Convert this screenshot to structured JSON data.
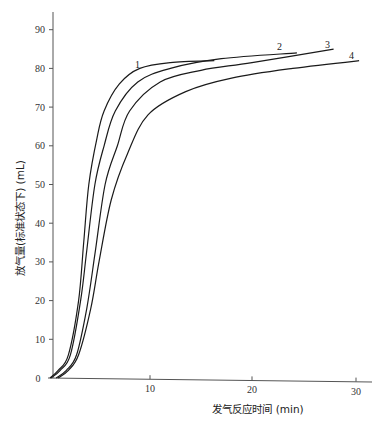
{
  "chart_data": {
    "type": "line",
    "title": "",
    "xlabel": "发气反应时间 (min)",
    "ylabel": "放气量(标准状态下) (mL)",
    "xlim": [
      0,
      32
    ],
    "ylim": [
      0,
      95
    ],
    "x_ticks": [
      10,
      20,
      30
    ],
    "y_ticks": [
      0,
      10,
      20,
      30,
      40,
      50,
      60,
      70,
      80,
      90
    ],
    "grid": false,
    "legend": "inline curve labels 1-4 at curve ends",
    "series": [
      {
        "name": "1",
        "points": [
          [
            0.2,
            0
          ],
          [
            1,
            2
          ],
          [
            2,
            6
          ],
          [
            3,
            20
          ],
          [
            3.5,
            35
          ],
          [
            4,
            50
          ],
          [
            4.8,
            62
          ],
          [
            5.5,
            69
          ],
          [
            7,
            76
          ],
          [
            9,
            80
          ],
          [
            12,
            81.5
          ],
          [
            16.3,
            82
          ]
        ]
      },
      {
        "name": "2",
        "points": [
          [
            0.3,
            0
          ],
          [
            1.2,
            2
          ],
          [
            2.2,
            6
          ],
          [
            3.2,
            20
          ],
          [
            3.8,
            33
          ],
          [
            4.6,
            50
          ],
          [
            5.5,
            60
          ],
          [
            6.6,
            69
          ],
          [
            8.8,
            76.5
          ],
          [
            12,
            80
          ],
          [
            17,
            82.5
          ],
          [
            24.4,
            84
          ]
        ]
      },
      {
        "name": "3",
        "points": [
          [
            0.8,
            0
          ],
          [
            1.8,
            2
          ],
          [
            2.8,
            6
          ],
          [
            3.8,
            18
          ],
          [
            4.6,
            32
          ],
          [
            5.6,
            50
          ],
          [
            6.8,
            60
          ],
          [
            8,
            69
          ],
          [
            11,
            76.5
          ],
          [
            15,
            79.5
          ],
          [
            20,
            81.5
          ],
          [
            28,
            85
          ]
        ]
      },
      {
        "name": "4",
        "points": [
          [
            1,
            0
          ],
          [
            2,
            2
          ],
          [
            3,
            6
          ],
          [
            4.2,
            18
          ],
          [
            5,
            30
          ],
          [
            6.2,
            46
          ],
          [
            7.8,
            58
          ],
          [
            9.8,
            68
          ],
          [
            13.5,
            74
          ],
          [
            18,
            77.5
          ],
          [
            24,
            80
          ],
          [
            30.5,
            82
          ]
        ]
      }
    ]
  },
  "labels": {
    "origin": "0",
    "curve_labels": [
      "1",
      "2",
      "3",
      "4"
    ]
  }
}
